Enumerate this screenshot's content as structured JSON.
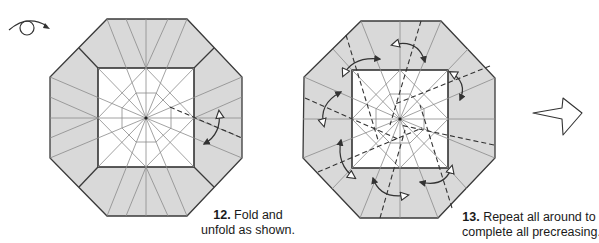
{
  "diagram": {
    "type": "origami-step-diagram",
    "colors": {
      "paper_colored": "#d9d9d9",
      "paper_white": "#ffffff",
      "edge": "#3a3a3a",
      "crease": "#8a8a8a",
      "dash": "#333333"
    },
    "symbols": {
      "turn_over": "turn-over-icon",
      "next_step": "hollow-right-arrow-icon"
    },
    "steps": [
      {
        "number": "12.",
        "line1": "Fold and",
        "line2": "unfold as shown.",
        "arrows": 1,
        "dashed_lines": 1
      },
      {
        "number": "13.",
        "line1": "Repeat all around to",
        "line2": "complete all precreasing.",
        "arrows": 8,
        "dashed_lines": 8
      }
    ]
  }
}
